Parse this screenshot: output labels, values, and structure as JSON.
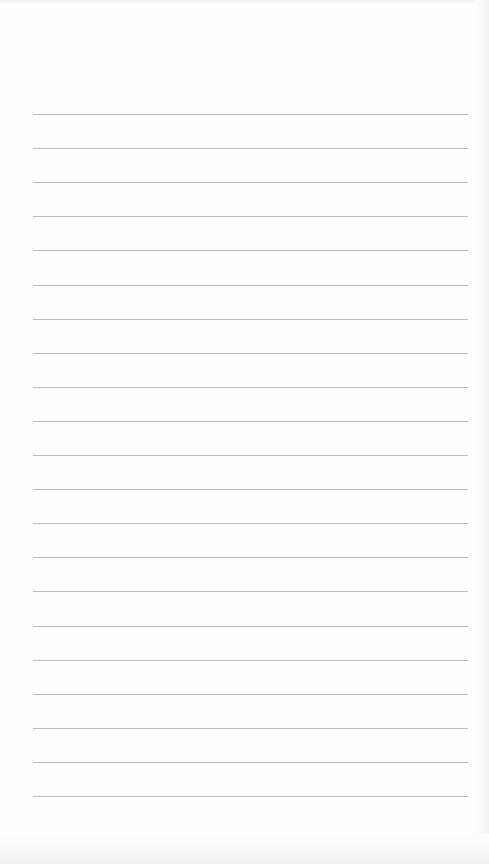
{
  "paper": {
    "type": "lined-paper",
    "background_color": "#fefefe",
    "line_color": "#b9b9b9",
    "line_count": 21,
    "line_left": 33,
    "line_right": 468,
    "first_line_y": 114,
    "line_spacing": 34.1
  }
}
